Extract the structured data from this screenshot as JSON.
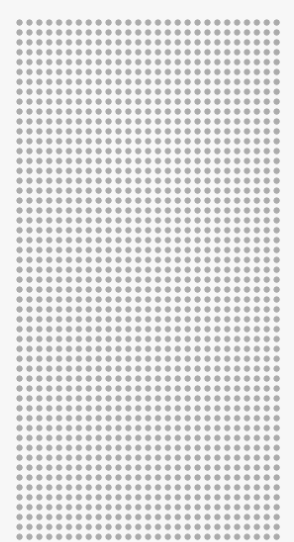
{
  "pattern": {
    "type": "dot-grid",
    "columns": 27,
    "rows": 53,
    "spacing_px": 9.9,
    "dot_diameter_px": 6,
    "dot_color": "#ababab",
    "background_color": "#f7f7f7"
  }
}
